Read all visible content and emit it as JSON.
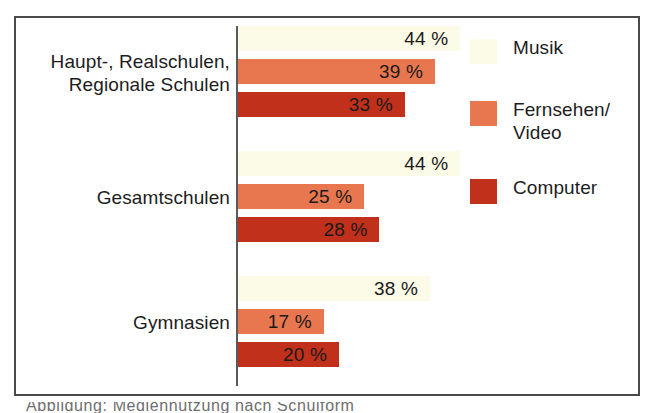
{
  "figure": {
    "frame_color": "#4a4a4a",
    "axis_color": "#5a5a5a",
    "background": "#ffffff",
    "caption_partial": "Abbildung: Mediennutzung nach Schulform"
  },
  "legend": {
    "position": "right",
    "items": [
      {
        "label": "Musik",
        "color": "#fbfbe8"
      },
      {
        "label": "Fernsehen/\nVideo",
        "color": "#e8764f"
      },
      {
        "label": "Computer",
        "color": "#c0301a"
      }
    ]
  },
  "chart_data": {
    "type": "bar",
    "orientation": "horizontal",
    "title": "",
    "subtitle": "",
    "xlabel": "",
    "ylabel": "",
    "grid": false,
    "legend_position": "right",
    "value_suffix": " %",
    "xlim": [
      0,
      50
    ],
    "categories": [
      "Haupt-, Realschulen,\nRegionale Schulen",
      "Gesamtschulen",
      "Gymnasien"
    ],
    "series": [
      {
        "name": "Musik",
        "color": "#fbfbe8",
        "values": [
          44,
          44,
          38
        ]
      },
      {
        "name": "Fernsehen/Video",
        "color": "#e8764f",
        "values": [
          39,
          25,
          17
        ]
      },
      {
        "name": "Computer",
        "color": "#c0301a",
        "values": [
          33,
          28,
          20
        ]
      }
    ],
    "data_labels": [
      [
        "44 %",
        "39 %",
        "33 %"
      ],
      [
        "44 %",
        "25 %",
        "28 %"
      ],
      [
        "38 %",
        "17 %",
        "20 %"
      ]
    ]
  }
}
